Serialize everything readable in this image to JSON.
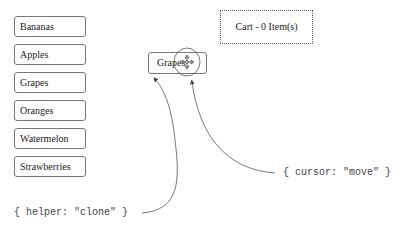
{
  "product_list": {
    "items": [
      {
        "label": "Bananas"
      },
      {
        "label": "Apples"
      },
      {
        "label": "Grapes"
      },
      {
        "label": "Oranges"
      },
      {
        "label": "Watermelon"
      },
      {
        "label": "Strawberries"
      }
    ]
  },
  "drag_helper": {
    "label": "Grapes",
    "icon": "move-icon"
  },
  "cart": {
    "label": "Cart - 0 Item(s)"
  },
  "annotations": {
    "helper_option": "{ helper: \"clone\" }",
    "cursor_option": "{ cursor: \"move\" }"
  }
}
